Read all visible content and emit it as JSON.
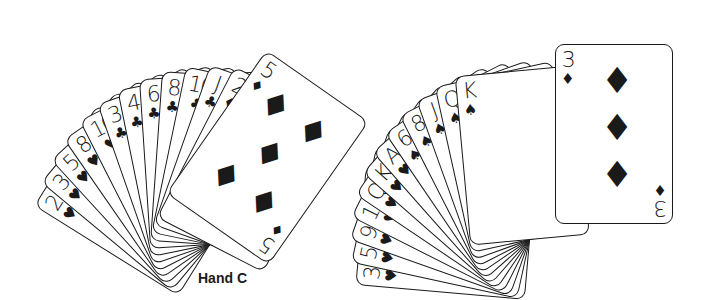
{
  "hands": [
    {
      "label": "Hand C",
      "cards": [
        {
          "rank": "2",
          "suit": "♥"
        },
        {
          "rank": "3",
          "suit": "♥"
        },
        {
          "rank": "5",
          "suit": "♥"
        },
        {
          "rank": "8",
          "suit": "♥"
        },
        {
          "rank": "10",
          "suit": "♥"
        },
        {
          "rank": "3",
          "suit": "♣"
        },
        {
          "rank": "4",
          "suit": "♣"
        },
        {
          "rank": "6",
          "suit": "♣"
        },
        {
          "rank": "8",
          "suit": "♣"
        },
        {
          "rank": "10",
          "suit": "♣"
        },
        {
          "rank": "J",
          "suit": "♣"
        },
        {
          "rank": "2",
          "suit": "♦"
        },
        {
          "rank": "5",
          "suit": "♦"
        }
      ]
    },
    {
      "label": "Hand D",
      "cards": [
        {
          "rank": "3",
          "suit": "♥"
        },
        {
          "rank": "5",
          "suit": "♥"
        },
        {
          "rank": "9",
          "suit": "♥"
        },
        {
          "rank": "10",
          "suit": "♥"
        },
        {
          "rank": "Q",
          "suit": "♥"
        },
        {
          "rank": "K",
          "suit": "♥"
        },
        {
          "rank": "A",
          "suit": "♥"
        },
        {
          "rank": "6",
          "suit": "♠"
        },
        {
          "rank": "8",
          "suit": "♠"
        },
        {
          "rank": "J",
          "suit": "♠"
        },
        {
          "rank": "Q",
          "suit": "♠"
        },
        {
          "rank": "K",
          "suit": "♠"
        },
        {
          "rank": "3",
          "suit": "♦"
        }
      ]
    }
  ]
}
